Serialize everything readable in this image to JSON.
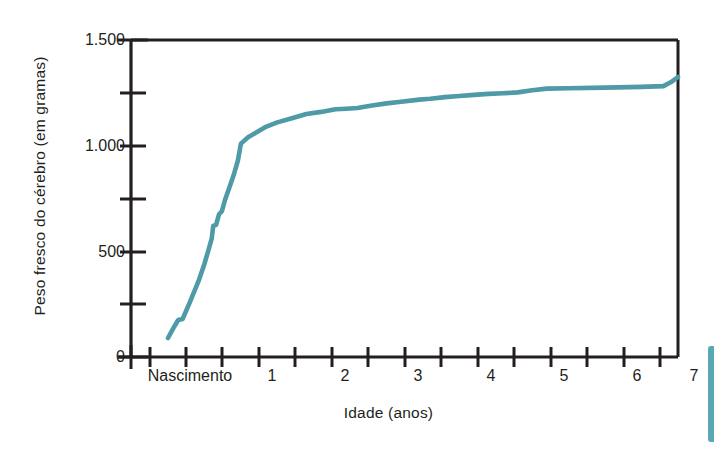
{
  "chart_data": {
    "type": "line",
    "title": "",
    "xlabel": "Idade (anos)",
    "ylabel": "Peso fresco do cérebro (em gramas)",
    "xlim": [
      0,
      7.2
    ],
    "ylim": [
      0,
      1500
    ],
    "grid": false,
    "legend": null,
    "x_tick_labels": [
      "Nascimento",
      "1",
      "2",
      "3",
      "4",
      "5",
      "6",
      "7"
    ],
    "x_tick_values": [
      0,
      1,
      2,
      3,
      4,
      5,
      6,
      7
    ],
    "x_minor_tick_values": [
      0.25,
      0.5,
      0.75,
      1.25,
      1.5,
      1.75,
      2.25,
      2.5,
      2.75,
      3.25,
      3.5,
      3.75,
      4.25,
      4.5,
      4.75,
      5.25,
      5.5,
      5.75,
      6.25,
      6.5,
      6.75
    ],
    "y_tick_labels": [
      "0",
      "500",
      "1.000",
      "1.500"
    ],
    "y_tick_values": [
      0,
      500,
      1000,
      1500
    ],
    "y_minor_tick_values": [
      250,
      750,
      1250
    ],
    "series": [
      {
        "name": "Peso fresco do cérebro",
        "color": "#4e9aa6",
        "x": [
          0.0,
          0.08,
          0.14,
          0.2,
          0.3,
          0.42,
          0.5,
          0.55,
          0.6,
          0.62,
          0.66,
          0.7,
          0.74,
          0.78,
          0.84,
          0.9,
          0.96,
          1.0,
          1.1,
          1.2,
          1.35,
          1.5,
          1.7,
          1.9,
          2.1,
          2.3,
          2.45,
          2.6,
          2.8,
          3.0,
          3.2,
          3.45,
          3.6,
          3.8,
          4.0,
          4.2,
          4.4,
          4.6,
          4.8,
          5.0,
          5.2,
          5.5,
          6.0,
          6.5,
          6.8,
          6.9,
          7.0
        ],
        "y": [
          90,
          140,
          175,
          180,
          260,
          360,
          440,
          500,
          560,
          620,
          625,
          675,
          690,
          740,
          800,
          860,
          930,
          1010,
          1040,
          1060,
          1090,
          1110,
          1130,
          1150,
          1160,
          1172,
          1175,
          1178,
          1190,
          1200,
          1208,
          1218,
          1222,
          1230,
          1235,
          1240,
          1245,
          1248,
          1252,
          1262,
          1270,
          1272,
          1275,
          1278,
          1282,
          1300,
          1325
        ]
      }
    ]
  },
  "figure": {
    "axis_color": "#231f20",
    "line_color": "#4e9aa6",
    "background": "#ffffff",
    "edge_sliver_color": "#5aa8b4"
  }
}
